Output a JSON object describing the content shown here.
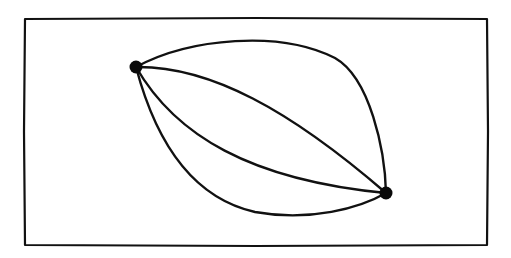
{
  "diagram": {
    "type": "multigraph",
    "colors": {
      "background": "#ffffff",
      "stroke": "#111111",
      "node": "#0a0a0a"
    },
    "frame": {
      "x1": 25,
      "y1": 18,
      "x2": 487,
      "y2": 245
    },
    "nodes": [
      {
        "id": "A",
        "x": 136,
        "y": 67,
        "r": 6.5
      },
      {
        "id": "B",
        "x": 386,
        "y": 193,
        "r": 6.5
      }
    ],
    "edges": [
      {
        "id": "outer-top",
        "from": "A",
        "to": "B",
        "path": "M136,67 C190,38 280,30 335,58 C370,78 385,150 386,193"
      },
      {
        "id": "inner-top",
        "from": "A",
        "to": "B",
        "path": "M136,67 C210,66 290,110 386,193"
      },
      {
        "id": "inner-bottom",
        "from": "A",
        "to": "B",
        "path": "M136,67 C175,135 250,180 386,193"
      },
      {
        "id": "outer-bottom",
        "from": "A",
        "to": "B",
        "path": "M136,67 C150,120 180,195 255,212 C310,222 360,208 386,193"
      }
    ]
  }
}
